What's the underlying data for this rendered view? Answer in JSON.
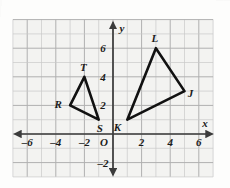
{
  "figure": {
    "kind": "coordinate-plane",
    "background_color": "#f3f3f1",
    "grid_color": "#c9c9c9",
    "grid_major_color": "#b0b0b0",
    "axis_color": "#3b3b3b",
    "shape_color": "#111111",
    "cropped_top_text": "",
    "grid": {
      "x_min": -7,
      "x_max": 7,
      "y_min": -3,
      "y_max": 8,
      "step": 1,
      "px_per_unit": 14.3,
      "origin_px": {
        "x": 113,
        "y": 134
      }
    },
    "axes": {
      "x_axis_label": "x",
      "y_axis_label": "y",
      "origin_label": "O",
      "x_ticks": [
        {
          "value": -6,
          "label": "–6"
        },
        {
          "value": -4,
          "label": "–4"
        },
        {
          "value": -2,
          "label": "–2"
        },
        {
          "value": 2,
          "label": "2"
        },
        {
          "value": 4,
          "label": "4"
        },
        {
          "value": 6,
          "label": "6"
        }
      ],
      "y_ticks": [
        {
          "value": 6,
          "label": "6"
        },
        {
          "value": 4,
          "label": "4"
        },
        {
          "value": 2,
          "label": "2"
        },
        {
          "value": -2,
          "label": "–2"
        }
      ]
    },
    "shapes": [
      {
        "name": "triangle-rst",
        "vertices": [
          {
            "label": "T",
            "x": -2,
            "y": 4,
            "label_dx": -1,
            "label_dy": -6
          },
          {
            "label": "R",
            "x": -3,
            "y": 2,
            "label_dx": -12,
            "label_dy": 3
          },
          {
            "label": "S",
            "x": -1,
            "y": 1,
            "label_dx": 1,
            "label_dy": 12
          }
        ]
      },
      {
        "name": "triangle-jkl",
        "vertices": [
          {
            "label": "L",
            "x": 3,
            "y": 6,
            "label_dx": -1,
            "label_dy": -6
          },
          {
            "label": "J",
            "x": 5,
            "y": 3,
            "label_dx": 6,
            "label_dy": 6
          },
          {
            "label": "K",
            "x": 1,
            "y": 1,
            "label_dx": -10,
            "label_dy": 11
          }
        ]
      }
    ]
  }
}
